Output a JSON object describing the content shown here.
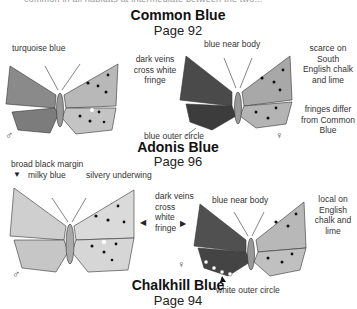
{
  "header_fragment": "common in all habitats  at intermediate between the two...",
  "species": [
    {
      "name": "Common Blue",
      "page": "Page 92",
      "labels": {
        "male_upper": "turquoise blue",
        "veins": [
          "dark veins",
          "cross white",
          "fringe"
        ],
        "near_body": "blue near body",
        "outer_circle": "blue outer circle",
        "distribution": [
          "scarce on",
          "South",
          "English chalk",
          "and lime"
        ],
        "fringes": [
          "fringes differ",
          "from Common",
          "Blue"
        ]
      },
      "male_symbol": "♂",
      "female_symbol": "♀",
      "colors": {
        "wing": "#8a8a8a",
        "wing_dark": "#3a3a3a",
        "under": "#c4c4c4"
      }
    },
    {
      "name": "Adonis Blue",
      "page": "Page 96",
      "labels": {
        "margin": "broad black margin",
        "milky": "milky blue",
        "silvery": "silvery underwing",
        "veins": [
          "dark veins",
          "cross",
          "white",
          "fringe"
        ],
        "near_body": "blue near body",
        "distribution": [
          "local on",
          "English",
          "chalk and",
          "lime"
        ],
        "outer_circle": "white outer circle"
      },
      "male_symbol": "♂",
      "female_symbol": "♀",
      "colors": {
        "wing": "#bdbdbd",
        "wing_dark": "#3a3a3a",
        "under": "#d6d6d6"
      }
    },
    {
      "name": "Chalkhill Blue",
      "page": "Page 94"
    }
  ]
}
